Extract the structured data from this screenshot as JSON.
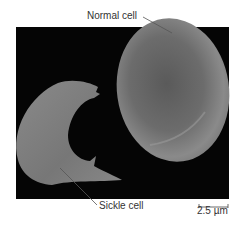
{
  "figure": {
    "labels": {
      "normal": "Normal cell",
      "sickle": "Sickle cell"
    },
    "scale_bar": {
      "text": "2.5 µm"
    },
    "colors": {
      "background": "#ffffff",
      "panel": "#050505",
      "cell_fill": "#7a7a7a",
      "leader_line": "#555555"
    }
  }
}
